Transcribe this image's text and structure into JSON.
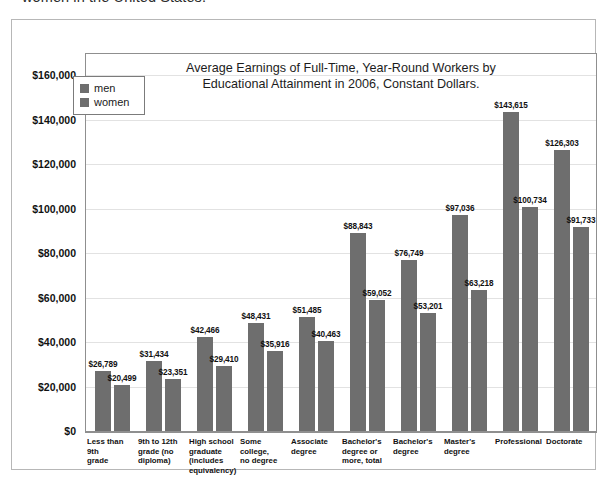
{
  "caption": {
    "text": "women in the United States."
  },
  "chart_data": {
    "type": "bar",
    "title": "Average Earnings of Full-Time, Year-Round Workers by\nEducational Attainment in 2006, Constant Dollars.",
    "xlabel": "",
    "ylabel": "",
    "ylim": [
      0,
      170000
    ],
    "grid": true,
    "legend_position": "upper-left-inside",
    "bar_color": "#6e6e6e",
    "categories": [
      "Less than 9th grade",
      "9th to 12th grade (no diploma)",
      "High school graduate (includes equivalency)",
      "Some college, no degree",
      "Associate degree",
      "Bachelor's degree or more, total",
      "Bachelor's degree",
      "Master's degree",
      "Professional",
      "Doctorate"
    ],
    "category_label_lines": [
      [
        "Less than 9th",
        "grade"
      ],
      [
        "9th to 12th",
        "grade (no",
        "diploma)"
      ],
      [
        "High school",
        "graduate",
        "(includes",
        "equivalency)"
      ],
      [
        "Some college,",
        "no degree"
      ],
      [
        "Associate",
        "degree"
      ],
      [
        "Bachelor's",
        "degree or",
        "more, total"
      ],
      [
        "Bachelor's",
        "degree"
      ],
      [
        "Master's",
        "degree"
      ],
      [
        "Professional"
      ],
      [
        "Doctorate"
      ]
    ],
    "series": [
      {
        "name": "men",
        "values": [
          26789,
          31434,
          42466,
          48431,
          51485,
          88843,
          76749,
          97036,
          143615,
          126303
        ],
        "labels": [
          "$26,789",
          "$31,434",
          "$42,466",
          "$48,431",
          "$51,485",
          "$88,843",
          "$76,749",
          "$97,036",
          "$143,615",
          "$126,303"
        ]
      },
      {
        "name": "women",
        "values": [
          20499,
          23351,
          29410,
          35916,
          40463,
          59052,
          53201,
          63218,
          100734,
          91733
        ],
        "labels": [
          "$20,499",
          "$23,351",
          "$29,410",
          "$35,916",
          "$40,463",
          "$59,052",
          "$53,201",
          "$63,218",
          "$100,734",
          "$91,733"
        ]
      }
    ],
    "yticks": [
      0,
      20000,
      40000,
      60000,
      80000,
      100000,
      120000,
      140000,
      160000
    ],
    "ytick_labels": [
      "$0",
      "$20,000",
      "$40,000",
      "$60,000",
      "$80,000",
      "$100,000",
      "$120,000",
      "$140,000",
      "$160,000"
    ]
  },
  "legend": {
    "items": [
      {
        "label": "men",
        "color": "#6e6e6e"
      },
      {
        "label": "women",
        "color": "#6e6e6e"
      }
    ]
  }
}
